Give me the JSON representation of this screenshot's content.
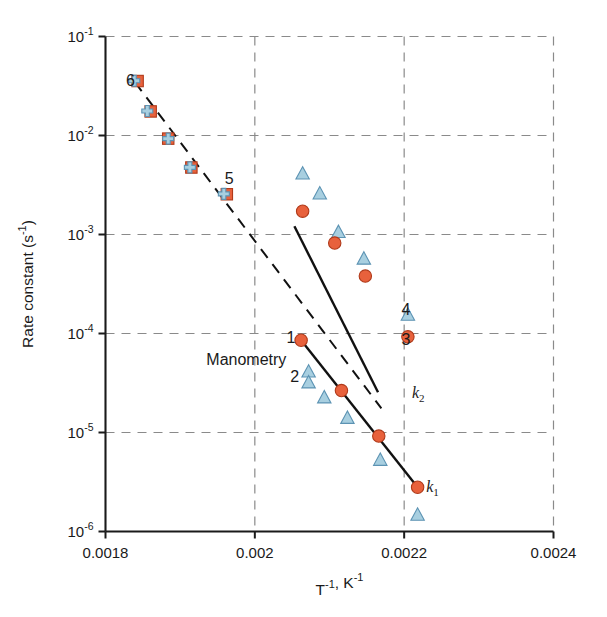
{
  "chart_data": {
    "type": "scatter",
    "title": "",
    "xlabel": "T⁻¹, K⁻¹",
    "ylabel": "Rate constant (s⁻¹)",
    "xscale": "linear",
    "yscale": "log",
    "xlim": [
      0.0018,
      0.0024
    ],
    "ylim": [
      1e-06,
      0.1
    ],
    "grid": true,
    "legend_position": "none",
    "xticks": [
      "0.0018",
      "0.002",
      "0.0022",
      "0.0024"
    ],
    "xtick_values": [
      0.0018,
      0.002,
      0.0022,
      0.0024
    ],
    "yticks": [
      "10⁻¹",
      "10⁻²",
      "10⁻³",
      "10⁻⁴",
      "10⁻⁵",
      "10⁻⁶"
    ],
    "ytick_values": [
      0.1,
      0.01,
      0.001,
      0.0001,
      1e-05,
      1e-06
    ],
    "ytick_mantissa": [
      "10",
      "10",
      "10",
      "10",
      "10",
      "10"
    ],
    "ytick_exponent": [
      "-1",
      "-2",
      "-3",
      "-4",
      "-5",
      "-6"
    ],
    "annotations": [
      {
        "text": "Manometry",
        "x": 0.001935,
        "y": 5.5e-05,
        "name": "manometry-annotation"
      },
      {
        "text": "6",
        "x": 0.0018395,
        "y": 0.0365,
        "name": "point-label-6"
      },
      {
        "text": "5",
        "x": 0.0019715,
        "y": 0.0037,
        "name": "point-label-5"
      },
      {
        "text": "4",
        "x": 0.0022085,
        "y": 0.000175,
        "name": "point-label-4"
      },
      {
        "text": "3",
        "x": 0.0022085,
        "y": 8.75e-05,
        "name": "point-label-3"
      },
      {
        "text": "1",
        "x": 0.0020545,
        "y": 9.2e-05,
        "name": "point-label-1"
      },
      {
        "text": "2",
        "x": 0.0020595,
        "y": 3.75e-05,
        "name": "point-label-2"
      }
    ],
    "series_labels": [
      {
        "text": "k",
        "sub": "2",
        "x": 0.0022105,
        "y": 2.55e-05,
        "name": "series-label-k2"
      },
      {
        "text": "k",
        "sub": "1",
        "x": 0.0022295,
        "y": 2.9e-06,
        "name": "series-label-k1"
      }
    ],
    "series": [
      {
        "name": "flow-square",
        "marker": "square",
        "color": "#e8613c",
        "edge": "#b03a1a",
        "x": [
          0.001843,
          0.0018605,
          0.001884,
          0.001915,
          0.0019625
        ],
        "y": [
          0.0355,
          0.0175,
          0.0093,
          0.00475,
          0.00255
        ]
      },
      {
        "name": "flow-cross",
        "marker": "cross",
        "color": "#a8cfe0",
        "edge": "#5c93b3",
        "x": [
          0.0018385,
          0.001856,
          0.001884,
          0.001913,
          0.0019585
        ],
        "y": [
          0.0357,
          0.0177,
          0.0093,
          0.00477,
          0.00257
        ]
      },
      {
        "name": "k2-triangle",
        "marker": "triangle",
        "color": "#a8cfe0",
        "edge": "#5c93b3",
        "x": [
          0.002064,
          0.002087,
          0.002112,
          0.002146,
          0.002205
        ],
        "y": [
          0.00405,
          0.00255,
          0.00104,
          0.00056,
          0.000152
        ]
      },
      {
        "name": "k2-circle",
        "marker": "circle",
        "color": "#e8613c",
        "edge": "#b03a1a",
        "x": [
          0.002064,
          0.002107,
          0.002148,
          0.002205
        ],
        "y": [
          0.00172,
          0.00082,
          0.00038,
          9.25e-05
        ]
      },
      {
        "name": "k1-circle",
        "marker": "circle",
        "color": "#e8613c",
        "edge": "#b03a1a",
        "x": [
          0.002062,
          0.002116,
          0.002166,
          0.002218
        ],
        "y": [
          8.55e-05,
          2.65e-05,
          9.2e-06,
          2.8e-06
        ]
      },
      {
        "name": "k1-triangle",
        "marker": "triangle",
        "color": "#a8cfe0",
        "edge": "#5c93b3",
        "x": [
          0.002072,
          0.002072,
          0.002093,
          0.002124,
          0.002168,
          0.002218
        ],
        "y": [
          4.05e-05,
          3.15e-05,
          2.22e-05,
          1.38e-05,
          5.2e-06,
          1.45e-06
        ]
      }
    ],
    "lines": [
      {
        "name": "flow-dashed-fit",
        "style": "dashed",
        "x": [
          0.0018395,
          0.0021695
        ],
        "y": [
          0.0345,
          1.75e-05
        ]
      },
      {
        "name": "k2-solid-fit",
        "style": "solid",
        "x": [
          0.002053,
          0.002165
        ],
        "y": [
          0.00121,
          2.55e-05
        ]
      },
      {
        "name": "k1-solid-fit",
        "style": "solid",
        "x": [
          0.002062,
          0.002218
        ],
        "y": [
          8.55e-05,
          2.8e-06
        ]
      }
    ]
  }
}
